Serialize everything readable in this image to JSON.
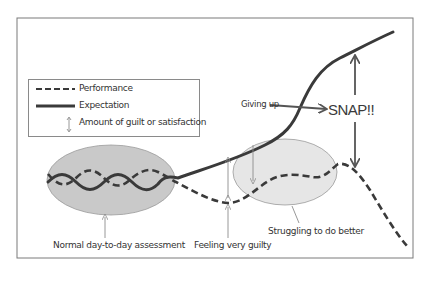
{
  "diagram": {
    "legend": {
      "items": [
        {
          "symbol": "dashed-line",
          "label": "Performance"
        },
        {
          "symbol": "solid-line",
          "label": "Expectation"
        },
        {
          "symbol": "double-arrow",
          "label": "Amount of guilt or satisfaction"
        }
      ]
    },
    "annotations": {
      "giving_up": "Giving up",
      "snap": "SNAP!!",
      "normal": "Normal day-to-day assessment",
      "guilty": "Feeling very guilty",
      "struggling": "Struggling to do better"
    },
    "regions": [
      {
        "name": "normal-assessment-oval",
        "fill": "#c9c9c9"
      },
      {
        "name": "struggling-oval",
        "fill": "#e6e6e6"
      }
    ],
    "series": [
      {
        "name": "Performance",
        "style": "dashed",
        "color": "#3a3a3a"
      },
      {
        "name": "Expectation",
        "style": "solid",
        "color": "#3a3a3a"
      }
    ],
    "colors": {
      "line": "#3a3a3a",
      "frame": "#7a7a7a",
      "arrow_thin": "#8c8c8c"
    }
  }
}
